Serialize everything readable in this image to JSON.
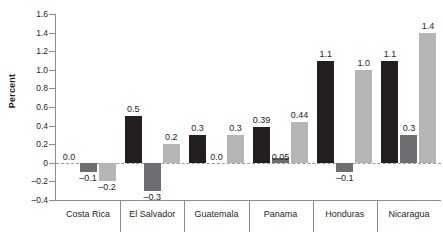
{
  "chart_data": {
    "type": "bar",
    "title": "",
    "xlabel": "",
    "ylabel": "Percent",
    "ylim": [
      -0.4,
      1.6
    ],
    "ytick_step": 0.2,
    "grid": false,
    "legend": "none",
    "zero_line": true,
    "categories": [
      "Costa Rica",
      "El Salvador",
      "Guatemala",
      "Panama",
      "Honduras",
      "Nicaragua"
    ],
    "ytick_labels": [
      "1.6",
      "1.4",
      "1.2",
      "1.0",
      "0.8",
      "0.6",
      "0.4",
      "0.2",
      "0",
      "–0.2",
      "–0.4"
    ],
    "ytick_values": [
      1.6,
      1.4,
      1.2,
      1.0,
      0.8,
      0.6,
      0.4,
      0.2,
      0,
      -0.2,
      -0.4
    ],
    "series": [
      {
        "name": "series-1",
        "color": "#231f20",
        "values": [
          0.0,
          0.5,
          0.3,
          0.39,
          1.1,
          1.1
        ],
        "labels": [
          "0.0",
          "0.5",
          "0.3",
          "0.39",
          "1.1",
          "1.1"
        ]
      },
      {
        "name": "series-2",
        "color": "#6d6e71",
        "values": [
          -0.1,
          -0.3,
          0.0,
          0.05,
          -0.1,
          0.3
        ],
        "labels": [
          "–0.1",
          "–0.3",
          "0.0",
          "0.05",
          "–0.1",
          "0.3"
        ]
      },
      {
        "name": "series-3",
        "color": "#b5b5b5",
        "values": [
          -0.2,
          0.2,
          0.3,
          0.44,
          1.0,
          1.4
        ],
        "labels": [
          "–0.2",
          "0.2",
          "0.3",
          "0.44",
          "1.0",
          "1.4"
        ]
      }
    ]
  },
  "colors": {
    "series_dark": "#231f20",
    "series_medium": "#6d6e71",
    "series_light": "#b5b5b5",
    "axis": "#8b8c8e",
    "zero_line": "#9a9b9d",
    "background": "#ffffff"
  }
}
